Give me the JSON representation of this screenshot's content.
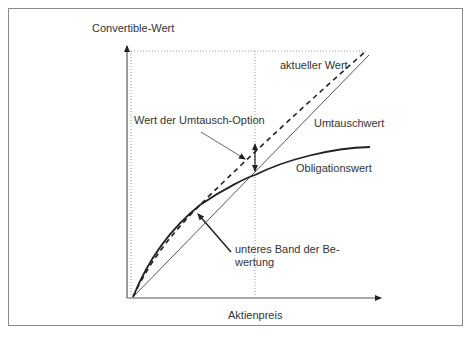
{
  "diagram": {
    "type": "convertible-bond-valuation",
    "y_axis_label": "Convertible-Wert",
    "x_axis_label": "Aktienpreis",
    "curves": {
      "current_value": "aktueller Wert",
      "conversion_value": "Umtauschwert",
      "bond_value": "Obligationswert"
    },
    "annotations": {
      "option_value": "Wert der Umtausch-Option",
      "lower_bound_line1": "unteres Band der Be-",
      "lower_bound_line2": "wertung"
    },
    "colors": {
      "line": "#222222",
      "thin_line": "#555555",
      "dotted": "#999999",
      "frame": "#8a8a8a",
      "text": "#333333"
    }
  }
}
